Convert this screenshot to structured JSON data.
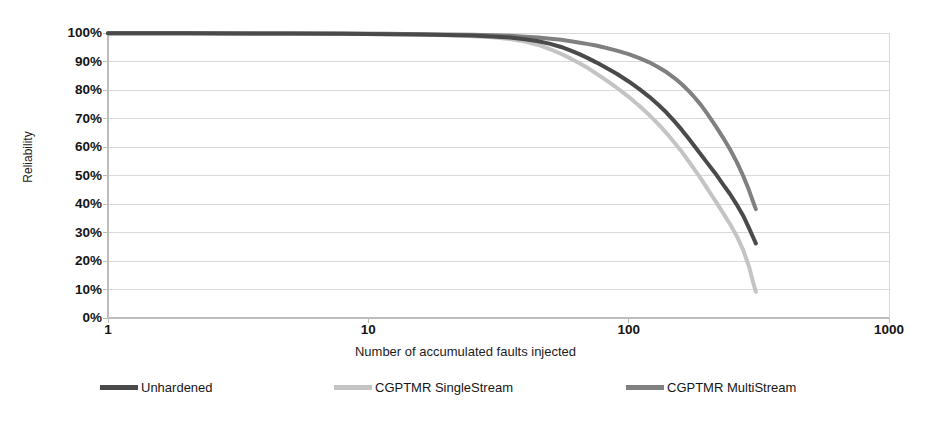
{
  "chart_data": {
    "type": "line",
    "title": "",
    "xlabel": "Number of accumulated faults injected",
    "ylabel": "Reliability",
    "xscale": "log",
    "xlim": [
      1,
      1000
    ],
    "ylim": [
      0,
      1
    ],
    "grid": true,
    "legend_position": "bottom",
    "x_ticks": [
      {
        "value": 1,
        "label": "1"
      },
      {
        "value": 10,
        "label": "10"
      },
      {
        "value": 100,
        "label": "100"
      },
      {
        "value": 1000,
        "label": "1000"
      }
    ],
    "y_ticks": [
      {
        "value": 1.0,
        "label": "100%"
      },
      {
        "value": 0.9,
        "label": "90%"
      },
      {
        "value": 0.8,
        "label": "80%"
      },
      {
        "value": 0.7,
        "label": "70%"
      },
      {
        "value": 0.6,
        "label": "60%"
      },
      {
        "value": 0.5,
        "label": "50%"
      },
      {
        "value": 0.4,
        "label": "40%"
      },
      {
        "value": 0.3,
        "label": "30%"
      },
      {
        "value": 0.2,
        "label": "20%"
      },
      {
        "value": 0.1,
        "label": "10%"
      },
      {
        "value": 0.0,
        "label": "0%"
      }
    ],
    "series": [
      {
        "name": "Unhardened",
        "color": "#4a4a4a",
        "width": 4,
        "points": [
          [
            1,
            0.999
          ],
          [
            2,
            0.999
          ],
          [
            3,
            0.998
          ],
          [
            5,
            0.998
          ],
          [
            8,
            0.997
          ],
          [
            12,
            0.996
          ],
          [
            16,
            0.995
          ],
          [
            20,
            0.993
          ],
          [
            25,
            0.991
          ],
          [
            30,
            0.988
          ],
          [
            35,
            0.984
          ],
          [
            40,
            0.978
          ],
          [
            45,
            0.971
          ],
          [
            50,
            0.962
          ],
          [
            55,
            0.951
          ],
          [
            60,
            0.938
          ],
          [
            65,
            0.925
          ],
          [
            70,
            0.911
          ],
          [
            75,
            0.897
          ],
          [
            80,
            0.883
          ],
          [
            90,
            0.857
          ],
          [
            100,
            0.83
          ],
          [
            110,
            0.803
          ],
          [
            120,
            0.776
          ],
          [
            130,
            0.748
          ],
          [
            140,
            0.72
          ],
          [
            150,
            0.69
          ],
          [
            160,
            0.66
          ],
          [
            170,
            0.63
          ],
          [
            180,
            0.6
          ],
          [
            190,
            0.572
          ],
          [
            200,
            0.545
          ],
          [
            215,
            0.508
          ],
          [
            230,
            0.47
          ],
          [
            245,
            0.435
          ],
          [
            260,
            0.398
          ],
          [
            275,
            0.36
          ],
          [
            290,
            0.315
          ],
          [
            300,
            0.285
          ],
          [
            308,
            0.262
          ]
        ]
      },
      {
        "name": "CGPTMR SingleStream",
        "color": "#c4c4c4",
        "width": 4,
        "points": [
          [
            1,
            0.999
          ],
          [
            2,
            0.999
          ],
          [
            3,
            0.998
          ],
          [
            5,
            0.998
          ],
          [
            8,
            0.997
          ],
          [
            12,
            0.996
          ],
          [
            16,
            0.994
          ],
          [
            20,
            0.992
          ],
          [
            25,
            0.989
          ],
          [
            30,
            0.985
          ],
          [
            35,
            0.979
          ],
          [
            40,
            0.97
          ],
          [
            45,
            0.958
          ],
          [
            50,
            0.943
          ],
          [
            55,
            0.927
          ],
          [
            60,
            0.91
          ],
          [
            65,
            0.893
          ],
          [
            70,
            0.876
          ],
          [
            75,
            0.858
          ],
          [
            80,
            0.841
          ],
          [
            90,
            0.808
          ],
          [
            100,
            0.776
          ],
          [
            110,
            0.744
          ],
          [
            120,
            0.712
          ],
          [
            130,
            0.68
          ],
          [
            140,
            0.648
          ],
          [
            150,
            0.615
          ],
          [
            160,
            0.583
          ],
          [
            170,
            0.55
          ],
          [
            180,
            0.518
          ],
          [
            190,
            0.487
          ],
          [
            200,
            0.456
          ],
          [
            215,
            0.412
          ],
          [
            230,
            0.37
          ],
          [
            245,
            0.33
          ],
          [
            260,
            0.288
          ],
          [
            275,
            0.24
          ],
          [
            290,
            0.18
          ],
          [
            300,
            0.128
          ],
          [
            308,
            0.092
          ]
        ]
      },
      {
        "name": "CGPTMR MultiStream",
        "color": "#808080",
        "width": 4,
        "points": [
          [
            1,
            0.999
          ],
          [
            2,
            0.999
          ],
          [
            3,
            0.999
          ],
          [
            5,
            0.998
          ],
          [
            8,
            0.998
          ],
          [
            12,
            0.997
          ],
          [
            16,
            0.996
          ],
          [
            20,
            0.995
          ],
          [
            25,
            0.994
          ],
          [
            30,
            0.992
          ],
          [
            35,
            0.99
          ],
          [
            40,
            0.987
          ],
          [
            45,
            0.984
          ],
          [
            50,
            0.98
          ],
          [
            55,
            0.976
          ],
          [
            60,
            0.971
          ],
          [
            65,
            0.966
          ],
          [
            70,
            0.961
          ],
          [
            75,
            0.956
          ],
          [
            80,
            0.95
          ],
          [
            90,
            0.938
          ],
          [
            100,
            0.926
          ],
          [
            110,
            0.912
          ],
          [
            120,
            0.897
          ],
          [
            130,
            0.88
          ],
          [
            140,
            0.862
          ],
          [
            150,
            0.842
          ],
          [
            160,
            0.82
          ],
          [
            170,
            0.797
          ],
          [
            180,
            0.772
          ],
          [
            190,
            0.746
          ],
          [
            200,
            0.718
          ],
          [
            215,
            0.676
          ],
          [
            230,
            0.634
          ],
          [
            245,
            0.592
          ],
          [
            260,
            0.548
          ],
          [
            275,
            0.5
          ],
          [
            290,
            0.448
          ],
          [
            300,
            0.41
          ],
          [
            308,
            0.382
          ]
        ]
      }
    ]
  },
  "axes": {
    "y_title": "Reliability",
    "x_title": "Number of accumulated faults injected"
  },
  "legend": {
    "items": [
      {
        "label": "Unhardened",
        "color": "#4a4a4a"
      },
      {
        "label": "CGPTMR SingleStream",
        "color": "#c4c4c4"
      },
      {
        "label": "CGPTMR MultiStream",
        "color": "#808080"
      }
    ]
  },
  "colors": {
    "grid": "#d9d9d9",
    "axis": "#bdbdbd",
    "text": "#141414",
    "background": "#ffffff"
  }
}
